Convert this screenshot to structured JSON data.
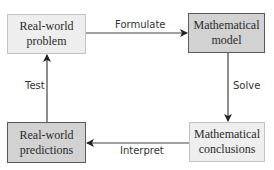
{
  "diagram": {
    "nodes": [
      {
        "id": "real-world-problem",
        "label_line1": "Real-world",
        "label_line2": "problem",
        "shade": "light"
      },
      {
        "id": "mathematical-model",
        "label_line1": "Mathematical",
        "label_line2": "model",
        "shade": "dark"
      },
      {
        "id": "mathematical-conclusions",
        "label_line1": "Mathematical",
        "label_line2": "conclusions",
        "shade": "light"
      },
      {
        "id": "real-world-predictions",
        "label_line1": "Real-world",
        "label_line2": "predictions",
        "shade": "dark"
      }
    ],
    "edges": [
      {
        "from": "real-world-problem",
        "to": "mathematical-model",
        "label": "Formulate"
      },
      {
        "from": "mathematical-model",
        "to": "mathematical-conclusions",
        "label": "Solve"
      },
      {
        "from": "mathematical-conclusions",
        "to": "real-world-predictions",
        "label": "Interpret"
      },
      {
        "from": "real-world-predictions",
        "to": "real-world-problem",
        "label": "Test"
      }
    ],
    "colors": {
      "light_fill": "#eeeeee",
      "dark_fill": "#d2d2d2",
      "arrow": "#333333"
    }
  }
}
